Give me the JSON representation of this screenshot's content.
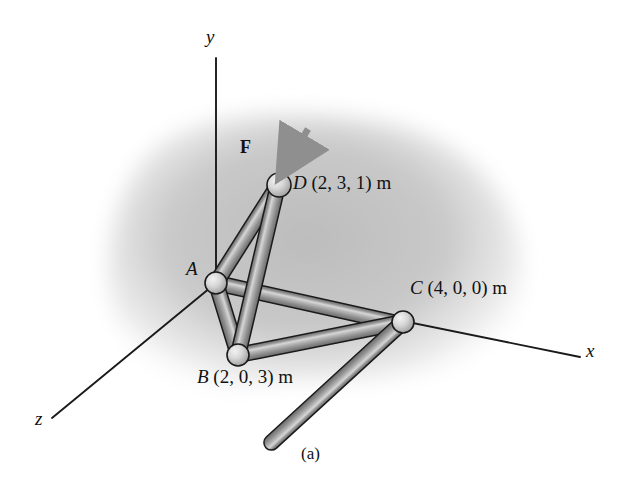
{
  "figure": {
    "caption": "(a)",
    "background_color": "#ffffff",
    "shadow_color": "#c9c9c9",
    "member_color": "#9a9a9a",
    "member_edge_color": "#1a1a1a",
    "joint_color": "#cfcfcf",
    "axis_color": "#1a1a1a",
    "force_arrow_color": "#8f8f8f"
  },
  "axes": [
    {
      "name": "y-axis",
      "label": "y",
      "label_x": 206,
      "label_y": 26,
      "x1": 216,
      "y1": 58,
      "x2": 216,
      "y2": 283
    },
    {
      "name": "x-axis",
      "label": "x",
      "label_x": 586,
      "label_y": 340,
      "x1": 216,
      "y1": 283,
      "x2": 580,
      "y2": 357
    },
    {
      "name": "z-axis",
      "label": "z",
      "label_x": 35,
      "label_y": 408,
      "x1": 216,
      "y1": 283,
      "x2": 52,
      "y2": 418
    }
  ],
  "joints": [
    {
      "id": "A",
      "label": "A",
      "coords": "",
      "label_text": "A",
      "x": 216,
      "y": 283,
      "r": 11,
      "label_x": 186,
      "label_y": 258
    },
    {
      "id": "B",
      "label": "B",
      "coords": "(2, 0, 3) m",
      "label_text": "B (2, 0, 3) m",
      "x": 238,
      "y": 355,
      "r": 11,
      "label_x": 197,
      "label_y": 366
    },
    {
      "id": "C",
      "label": "C",
      "coords": "(4, 0, 0) m",
      "label_text": "C (4, 0, 0) m",
      "x": 403,
      "y": 322,
      "r": 11,
      "label_x": 410,
      "label_y": 277
    },
    {
      "id": "D",
      "label": "D",
      "coords": "(2, 3, 1) m",
      "label_text": "D (2, 3, 1) m",
      "x": 279,
      "y": 185,
      "r": 12,
      "label_x": 293,
      "label_y": 172
    }
  ],
  "members": [
    {
      "name": "member-AD",
      "from": "A",
      "to": "D",
      "thickness": 13
    },
    {
      "name": "member-BD",
      "from": "B",
      "to": "D",
      "thickness": 13
    },
    {
      "name": "member-CD",
      "from": "C",
      "to": "D",
      "thickness": 13
    },
    {
      "name": "member-AB",
      "from": "A",
      "to": "B",
      "thickness": 13
    },
    {
      "name": "member-AC",
      "from": "A",
      "to": "C",
      "thickness": 13
    },
    {
      "name": "member-BC",
      "from": "B",
      "to": "C",
      "thickness": 13
    }
  ],
  "force": {
    "label": "F",
    "label_x": 240,
    "label_y": 137,
    "tail_x": 308,
    "tail_y": 129,
    "head_x": 281,
    "head_y": 174
  }
}
